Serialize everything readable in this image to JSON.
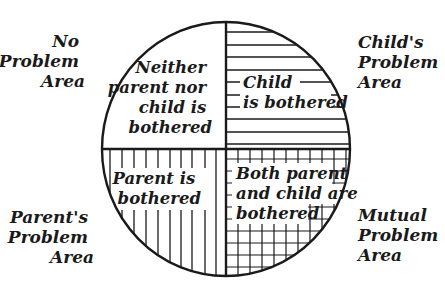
{
  "diagram": {
    "type": "quadrant-circle",
    "center": [
      226,
      149
    ],
    "radius_x": 124,
    "radius_y": 127,
    "stroke_color": "#1a1a1a",
    "background": "#ffffff"
  },
  "outer_labels": {
    "top_left": {
      "lines": [
        "No",
        "Problem",
        "Area"
      ]
    },
    "top_right": {
      "lines": [
        "Child's",
        "Problem",
        "Area"
      ]
    },
    "bottom_left": {
      "lines": [
        "Parent's",
        "Problem",
        "Area"
      ]
    },
    "bottom_right": {
      "lines": [
        "Mutual",
        "Problem",
        "Area"
      ]
    }
  },
  "quadrants": {
    "top_left": {
      "pattern": "none",
      "lines": [
        "Neither",
        "parent nor",
        "child is",
        "bothered"
      ]
    },
    "top_right": {
      "pattern": "horizontal-lines",
      "lines": [
        "Child",
        "is bothered"
      ]
    },
    "bottom_left": {
      "pattern": "vertical-lines",
      "lines": [
        "Parent is",
        "bothered"
      ]
    },
    "bottom_right": {
      "pattern": "grid",
      "lines": [
        "Both parent",
        "and child are",
        "bothered"
      ]
    }
  }
}
